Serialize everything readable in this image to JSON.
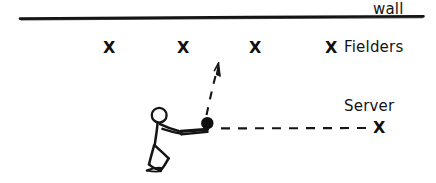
{
  "diagram": {
    "title_visible": false,
    "background_color": "#ffffff",
    "ink_color": "#141414",
    "wall": {
      "label": "wall",
      "line": {
        "x1": 20,
        "y1": 18,
        "x2": 423,
        "y2": 16
      }
    },
    "fielders": {
      "label": "Fielders",
      "marker": "X",
      "count": 4,
      "positions": [
        {
          "x": 109,
          "y": 48
        },
        {
          "x": 183,
          "y": 48
        },
        {
          "x": 255,
          "y": 48
        },
        {
          "x": 331,
          "y": 48
        }
      ]
    },
    "server": {
      "label": "Server",
      "marker": "X",
      "position": {
        "x": 379,
        "y": 128
      }
    },
    "ball": {
      "name": "ball",
      "center": {
        "x": 207,
        "y": 123
      },
      "radius": 6,
      "fill": "#101010"
    },
    "incoming_path": {
      "name": "serve-path",
      "style": "dashed",
      "from": {
        "x": 370,
        "y": 128
      },
      "to": {
        "x": 220,
        "y": 128
      }
    },
    "return_path": {
      "name": "return-arrow",
      "style": "dashed-with-arrowhead",
      "from": {
        "x": 207,
        "y": 116
      },
      "to": {
        "x": 218,
        "y": 65
      }
    },
    "batter": {
      "name": "kneeling-batter",
      "head": {
        "cx": 159,
        "cy": 115,
        "r": 7.5
      },
      "bat": {
        "x1": 181,
        "y1": 133,
        "x2": 209,
        "y2": 130
      }
    },
    "icons": {
      "wall_line": "horizontal-line-icon",
      "fielder_marker": "x-mark-icon",
      "server_marker": "x-mark-icon",
      "ball": "filled-circle-icon",
      "arrow": "arrow-up-icon",
      "figure": "stick-figure-icon"
    }
  }
}
